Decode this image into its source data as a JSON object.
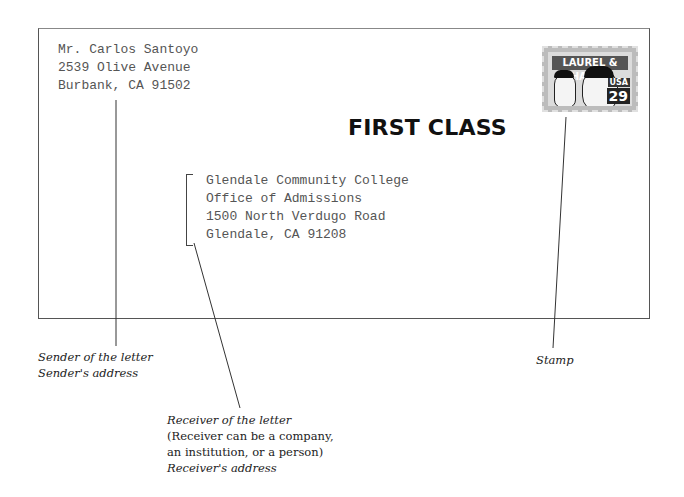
{
  "envelope": {
    "sender_address": [
      "Mr. Carlos Santoyo",
      "2539 Olive Avenue",
      "Burbank, CA 91502"
    ],
    "postage_class": "FIRST CLASS",
    "receiver_address": [
      "Glendale Community College",
      "Office of Admissions",
      "1500 North Verdugo Road",
      "Glendale, CA 91208"
    ],
    "stamp": {
      "title": "LAUREL & HARDY",
      "country": "USA",
      "value": "29"
    }
  },
  "labels": {
    "sender": {
      "line1": "Sender of the letter",
      "line2": "Sender's address"
    },
    "receiver": {
      "line1": "Receiver of the letter",
      "line2": "(Receiver can be a company,",
      "line3": "an institution, or a person)",
      "line4": "Receiver's address"
    },
    "stamp": "Stamp"
  }
}
